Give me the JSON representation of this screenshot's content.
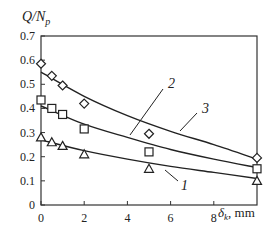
{
  "chart_data": {
    "type": "scatter",
    "title": "",
    "ylabel": "Q/N_p",
    "xlabel": "δ_k, mm",
    "xlim": [
      0,
      10
    ],
    "ylim": [
      0,
      0.7
    ],
    "xticks": [
      0,
      2,
      4,
      6,
      8
    ],
    "yticks": [
      0,
      0.1,
      0.2,
      0.3,
      0.4,
      0.5,
      0.6,
      0.7
    ],
    "grid": false,
    "series": [
      {
        "name": "1",
        "marker": "triangle",
        "x": [
          0,
          0.5,
          1,
          2,
          5,
          10
        ],
        "values": [
          0.28,
          0.26,
          0.245,
          0.21,
          0.15,
          0.1
        ],
        "fit": [
          [
            0,
            0.27
          ],
          [
            2,
            0.225
          ],
          [
            4,
            0.19
          ],
          [
            6,
            0.16
          ],
          [
            8,
            0.135
          ],
          [
            10,
            0.11
          ]
        ]
      },
      {
        "name": "2",
        "marker": "square",
        "x": [
          0,
          0.5,
          1,
          2,
          5,
          10
        ],
        "values": [
          0.435,
          0.4,
          0.375,
          0.315,
          0.22,
          0.15
        ],
        "fit": [
          [
            0,
            0.41
          ],
          [
            2,
            0.335
          ],
          [
            4,
            0.28
          ],
          [
            6,
            0.23
          ],
          [
            8,
            0.19
          ],
          [
            10,
            0.155
          ]
        ]
      },
      {
        "name": "3",
        "marker": "diamond",
        "x": [
          0,
          0.5,
          1,
          2,
          5,
          10
        ],
        "values": [
          0.585,
          0.535,
          0.495,
          0.42,
          0.295,
          0.195
        ],
        "fit": [
          [
            0,
            0.55
          ],
          [
            2,
            0.45
          ],
          [
            4,
            0.37
          ],
          [
            6,
            0.305
          ],
          [
            8,
            0.25
          ],
          [
            10,
            0.19
          ]
        ]
      }
    ],
    "annotations": [
      {
        "text": "1",
        "series": "1"
      },
      {
        "text": "2",
        "series": "2"
      },
      {
        "text": "3",
        "series": "3"
      }
    ]
  },
  "labels": {
    "y_main": "Q/N",
    "y_sub": "p",
    "x_main": "δ",
    "x_sub": "k",
    "x_unit": ", mm"
  }
}
